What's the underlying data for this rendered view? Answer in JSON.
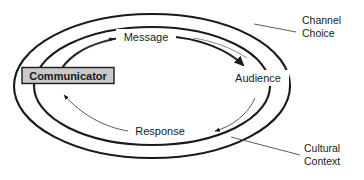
{
  "diagram": {
    "background_color": "#ffffff",
    "line_color": "#1a1a1a",
    "box_fill_color": "#c9c9c9",
    "nodes": {
      "communicator": {
        "label": "Communicator",
        "style": "boxed-gray"
      },
      "audience": {
        "label": "Audience",
        "style": "plain"
      }
    },
    "flow_labels": {
      "message": "Message",
      "response": "Response"
    },
    "annotations": {
      "channel_choice": {
        "line1": "Channel",
        "line2": "Choice"
      },
      "cultural_context": {
        "line1": "Cultural",
        "line2": "Context"
      }
    }
  }
}
